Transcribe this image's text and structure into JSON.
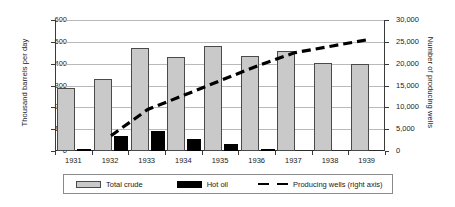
{
  "chart_data": {
    "type": "bar",
    "title": "",
    "subtitle": "",
    "xlabel": "",
    "ylabel": "Thousand barrels per day",
    "y2label": "Number of producing wells",
    "categories": [
      "1931",
      "1932",
      "1933",
      "1934",
      "1935",
      "1936",
      "1937",
      "1938",
      "1939"
    ],
    "series": [
      {
        "name": "Total crude",
        "type": "bar",
        "axis": "left",
        "color": "#c9c9c9",
        "values": [
          290,
          330,
          470,
          432,
          483,
          437,
          459,
          405,
          397
        ]
      },
      {
        "name": "Hot oil",
        "type": "bar",
        "axis": "left",
        "color": "#000000",
        "values": [
          3,
          67,
          93,
          57,
          30,
          3,
          0,
          0,
          0
        ]
      },
      {
        "name": "Producing wells (right axis)",
        "type": "line",
        "axis": "right",
        "color": "#000000",
        "style": "dashed",
        "values": [
          null,
          3500,
          9500,
          12800,
          16200,
          19500,
          22500,
          24000,
          25500
        ]
      }
    ],
    "ylim": [
      0,
      600
    ],
    "yticks": [
      0,
      100,
      200,
      300,
      400,
      500,
      600
    ],
    "ytick_labels": [
      "0",
      "100",
      "200",
      "300",
      "400",
      "500",
      "600"
    ],
    "y2lim": [
      0,
      30000
    ],
    "y2ticks": [
      0,
      5000,
      10000,
      15000,
      20000,
      25000,
      30000
    ],
    "y2tick_labels": [
      "0",
      "5,000",
      "10,000",
      "15,000",
      "20,000",
      "25,000",
      "30,000"
    ],
    "grid": true,
    "legend_position": "bottom"
  },
  "legend": {
    "items": [
      {
        "label": "Total crude",
        "marker": "filled-square-gray"
      },
      {
        "label": "Hot oil",
        "marker": "filled-square-black"
      },
      {
        "label": "Producing wells (right axis)",
        "marker": "dashed-line"
      }
    ]
  }
}
